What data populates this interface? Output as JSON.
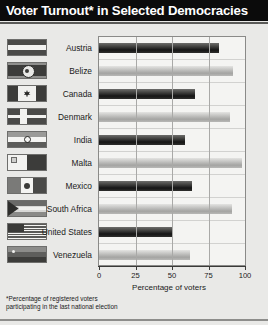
{
  "header": {
    "title": "Voter Turnout* in Selected Democracies"
  },
  "footnote": {
    "line1": "*Percentage of registered voters",
    "line2": "participating in the last national election"
  },
  "axis": {
    "xlabel": "Percentage of voters",
    "ticks": [
      "0",
      "25",
      "50",
      "75",
      "100"
    ]
  },
  "colors": {
    "title_bar": "#0b0b0b",
    "title_text": "#ffffff",
    "background": "#e9e9e7",
    "plot_background": "#f4f4f2",
    "bar_dark": "#151515",
    "bar_light": "#a4a4a2",
    "gridline": "#a9a9a7"
  },
  "rows": [
    {
      "country": "Austria",
      "value": 82,
      "shade": "dark",
      "flag": "flag-austria-icon"
    },
    {
      "country": "Belize",
      "value": 92,
      "shade": "light",
      "flag": "flag-belize-icon"
    },
    {
      "country": "Canada",
      "value": 66,
      "shade": "dark",
      "flag": "flag-canada-icon"
    },
    {
      "country": "Denmark",
      "value": 90,
      "shade": "light",
      "flag": "flag-denmark-icon"
    },
    {
      "country": "India",
      "value": 59,
      "shade": "dark",
      "flag": "flag-india-icon"
    },
    {
      "country": "Malta",
      "value": 98,
      "shade": "light",
      "flag": "flag-malta-icon"
    },
    {
      "country": "Mexico",
      "value": 64,
      "shade": "dark",
      "flag": "flag-mexico-icon"
    },
    {
      "country": "South Africa",
      "value": 91,
      "shade": "light",
      "flag": "flag-south-africa-icon"
    },
    {
      "country": "United States",
      "value": 50,
      "shade": "dark",
      "flag": "flag-united-states-icon"
    },
    {
      "country": "Venezuela",
      "value": 62,
      "shade": "light",
      "flag": "flag-venezuela-icon"
    }
  ],
  "chart_data": {
    "type": "bar",
    "orientation": "horizontal",
    "title": "Voter Turnout* in Selected Democracies",
    "xlabel": "Percentage of voters",
    "ylabel": "",
    "xlim": [
      0,
      100
    ],
    "xticks": [
      0,
      25,
      50,
      75,
      100
    ],
    "grid": true,
    "legend": false,
    "annotations": [
      "*Percentage of registered voters participating in the last national election"
    ],
    "categories": [
      "Austria",
      "Belize",
      "Canada",
      "Denmark",
      "India",
      "Malta",
      "Mexico",
      "South Africa",
      "United States",
      "Venezuela"
    ],
    "values": [
      82,
      92,
      66,
      90,
      59,
      98,
      64,
      91,
      50,
      62
    ]
  }
}
